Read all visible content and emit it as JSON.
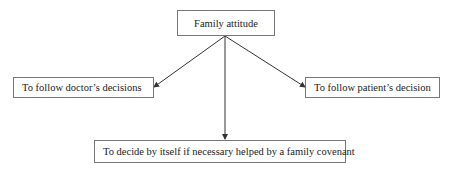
{
  "diagram": {
    "root": {
      "label": "Family attitude"
    },
    "children": [
      {
        "label": "To follow doctor’s decisions"
      },
      {
        "label": "To follow patient’s decision"
      },
      {
        "label": "To decide by itself if necessary helped by a family covenant"
      }
    ],
    "colors": {
      "border": "#777777",
      "arrow": "#333333",
      "text": "#222222"
    }
  }
}
